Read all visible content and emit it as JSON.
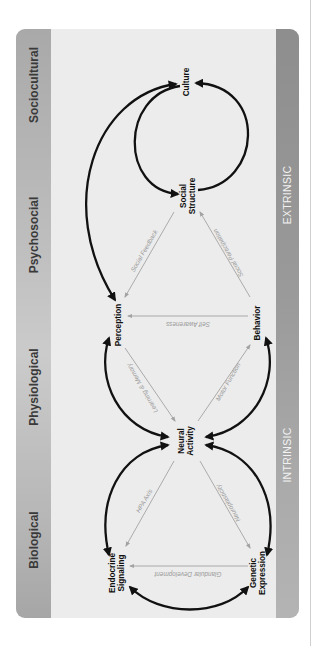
{
  "diagram": {
    "stages": [
      {
        "id": "sociocultural",
        "label": "Sociocultural"
      },
      {
        "id": "psychosocial",
        "label": "Psychosocial"
      },
      {
        "id": "physiological",
        "label": "Physiological"
      },
      {
        "id": "biological",
        "label": "Biological"
      }
    ],
    "side_labels": {
      "extrinsic": "EXTRINSIC",
      "intrinsic": "INTRINSIC"
    },
    "nodes": {
      "culture": {
        "line1": "Culture"
      },
      "social_structure": {
        "line1": "Social",
        "line2": "Structure"
      },
      "perception": {
        "line1": "Perception"
      },
      "behavior": {
        "line1": "Behavior"
      },
      "neural_activity": {
        "line1": "Neural",
        "line2": "Activity"
      },
      "endocrine_signaling": {
        "line1": "Endocrine",
        "line2": "Signaling"
      },
      "genetic_expression": {
        "line1": "Genetic",
        "line2": "Expression"
      }
    },
    "edge_labels": {
      "social_feedback": "Social Feedback",
      "social_participation": "Social Participation",
      "self_awareness": "Self Awareness",
      "learning_memory": "Learning & Memory",
      "motor_function": "Motor Function",
      "hpa_axis": "HPA Axis",
      "neuroplasticity": "Neuroplasticity",
      "glandular_development": "Glandular Development"
    },
    "colors": {
      "panel_bg": "#ececec",
      "band_left": "#bdbdbd",
      "band_right": "#9a9a9a",
      "thick_arrow": "#111111",
      "thin_arrow": "#a3a3a3"
    }
  }
}
